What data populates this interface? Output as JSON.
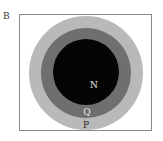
{
  "panel": {
    "label": "B"
  },
  "diagram": {
    "type": "concentric-euler-diagram",
    "circles": [
      {
        "id": "P",
        "label": "P",
        "color": "#b9b9b9",
        "label_color": "#222222"
      },
      {
        "id": "Q",
        "label": "Q",
        "color": "#6f6f6f",
        "label_color": "#e8e8e8"
      },
      {
        "id": "N",
        "label": "N",
        "color": "#050505",
        "label_color": "#e8e8e8"
      }
    ],
    "relationship": "N ⊂ Q ⊂ P"
  }
}
